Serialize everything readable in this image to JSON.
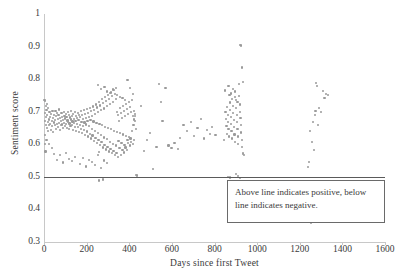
{
  "chart_data": {
    "type": "scatter",
    "title": "",
    "xlabel": "Days since first Tweet",
    "ylabel": "Sentiment score",
    "xlim": [
      0,
      1600
    ],
    "ylim": [
      0.3,
      1.0
    ],
    "xticks": [
      0,
      200,
      400,
      600,
      800,
      1000,
      1200,
      1400,
      1600
    ],
    "yticks": [
      0.3,
      0.4,
      0.5,
      0.6,
      0.7,
      0.8,
      0.9,
      1
    ],
    "xtick_labels": [
      "0",
      "200",
      "400",
      "600",
      "800",
      "1000",
      "1200",
      "1400",
      "1600"
    ],
    "ytick_labels": [
      "0.3",
      "0.4",
      "0.5",
      "0.6",
      "0.7",
      "0.8",
      "0.9",
      "1"
    ],
    "grid": false,
    "legend": null,
    "point_color": "#9a9a9a",
    "reference_line": {
      "y": 0.5,
      "color": "#5a5a5a",
      "label": "neutral sentiment threshold"
    },
    "annotations": [
      {
        "text": "Above line indicates positive, below line indicates negative.",
        "x": 1080,
        "y": 0.455,
        "boxed": true
      }
    ],
    "points": [
      [
        2,
        0.737
      ],
      [
        3,
        0.695
      ],
      [
        4,
        0.672
      ],
      [
        5,
        0.628
      ],
      [
        6,
        0.6
      ],
      [
        7,
        0.578
      ],
      [
        8,
        0.66
      ],
      [
        10,
        0.683
      ],
      [
        12,
        0.705
      ],
      [
        14,
        0.651
      ],
      [
        15,
        0.69
      ],
      [
        17,
        0.668
      ],
      [
        18,
        0.64
      ],
      [
        20,
        0.712
      ],
      [
        22,
        0.676
      ],
      [
        24,
        0.658
      ],
      [
        26,
        0.7
      ],
      [
        28,
        0.684
      ],
      [
        30,
        0.662
      ],
      [
        32,
        0.645
      ],
      [
        34,
        0.693
      ],
      [
        36,
        0.671
      ],
      [
        38,
        0.655
      ],
      [
        40,
        0.702
      ],
      [
        42,
        0.68
      ],
      [
        44,
        0.638
      ],
      [
        46,
        0.667
      ],
      [
        48,
        0.69
      ],
      [
        50,
        0.659
      ],
      [
        52,
        0.674
      ],
      [
        54,
        0.701
      ],
      [
        56,
        0.648
      ],
      [
        58,
        0.686
      ],
      [
        60,
        0.663
      ],
      [
        62,
        0.696
      ],
      [
        64,
        0.677
      ],
      [
        66,
        0.654
      ],
      [
        68,
        0.689
      ],
      [
        70,
        0.666
      ],
      [
        72,
        0.707
      ],
      [
        74,
        0.643
      ],
      [
        76,
        0.681
      ],
      [
        78,
        0.658
      ],
      [
        80,
        0.672
      ],
      [
        82,
        0.695
      ],
      [
        84,
        0.661
      ],
      [
        86,
        0.684
      ],
      [
        88,
        0.649
      ],
      [
        90,
        0.675
      ],
      [
        92,
        0.7
      ],
      [
        94,
        0.666
      ],
      [
        96,
        0.688
      ],
      [
        98,
        0.657
      ],
      [
        100,
        0.679
      ],
      [
        102,
        0.694
      ],
      [
        104,
        0.662
      ],
      [
        106,
        0.685
      ],
      [
        108,
        0.65
      ],
      [
        110,
        0.673
      ],
      [
        112,
        0.698
      ],
      [
        114,
        0.668
      ],
      [
        116,
        0.646
      ],
      [
        118,
        0.69
      ],
      [
        120,
        0.664
      ],
      [
        122,
        0.682
      ],
      [
        124,
        0.656
      ],
      [
        126,
        0.676
      ],
      [
        128,
        0.703
      ],
      [
        130,
        0.659
      ],
      [
        132,
        0.687
      ],
      [
        134,
        0.67
      ],
      [
        136,
        0.645
      ],
      [
        138,
        0.692
      ],
      [
        140,
        0.665
      ],
      [
        142,
        0.678
      ],
      [
        144,
        0.653
      ],
      [
        146,
        0.699
      ],
      [
        148,
        0.671
      ],
      [
        150,
        0.641
      ],
      [
        152,
        0.686
      ],
      [
        154,
        0.663
      ],
      [
        156,
        0.68
      ],
      [
        158,
        0.652
      ],
      [
        160,
        0.696
      ],
      [
        162,
        0.674
      ],
      [
        164,
        0.637
      ],
      [
        166,
        0.689
      ],
      [
        168,
        0.66
      ],
      [
        170,
        0.683
      ],
      [
        172,
        0.647
      ],
      [
        174,
        0.702
      ],
      [
        176,
        0.669
      ],
      [
        178,
        0.634
      ],
      [
        180,
        0.691
      ],
      [
        182,
        0.656
      ],
      [
        184,
        0.677
      ],
      [
        186,
        0.644
      ],
      [
        188,
        0.705
      ],
      [
        190,
        0.667
      ],
      [
        192,
        0.629
      ],
      [
        194,
        0.693
      ],
      [
        196,
        0.661
      ],
      [
        198,
        0.681
      ],
      [
        200,
        0.639
      ],
      [
        202,
        0.708
      ],
      [
        204,
        0.672
      ],
      [
        206,
        0.624
      ],
      [
        208,
        0.697
      ],
      [
        210,
        0.655
      ],
      [
        212,
        0.685
      ],
      [
        214,
        0.632
      ],
      [
        216,
        0.711
      ],
      [
        218,
        0.675
      ],
      [
        220,
        0.618
      ],
      [
        222,
        0.701
      ],
      [
        224,
        0.648
      ],
      [
        226,
        0.688
      ],
      [
        228,
        0.627
      ],
      [
        230,
        0.716
      ],
      [
        232,
        0.67
      ],
      [
        234,
        0.611
      ],
      [
        236,
        0.706
      ],
      [
        238,
        0.642
      ],
      [
        240,
        0.692
      ],
      [
        242,
        0.62
      ],
      [
        244,
        0.722
      ],
      [
        246,
        0.666
      ],
      [
        248,
        0.604
      ],
      [
        250,
        0.713
      ],
      [
        252,
        0.635
      ],
      [
        254,
        0.698
      ],
      [
        256,
        0.613
      ],
      [
        258,
        0.73
      ],
      [
        259,
        0.576
      ],
      [
        260,
        0.662
      ],
      [
        262,
        0.597
      ],
      [
        264,
        0.719
      ],
      [
        266,
        0.628
      ],
      [
        268,
        0.704
      ],
      [
        270,
        0.606
      ],
      [
        272,
        0.738
      ],
      [
        274,
        0.658
      ],
      [
        276,
        0.59
      ],
      [
        278,
        0.726
      ],
      [
        280,
        0.621
      ],
      [
        282,
        0.71
      ],
      [
        284,
        0.599
      ],
      [
        286,
        0.745
      ],
      [
        288,
        0.654
      ],
      [
        290,
        0.584
      ],
      [
        292,
        0.733
      ],
      [
        294,
        0.615
      ],
      [
        296,
        0.717
      ],
      [
        298,
        0.592
      ],
      [
        300,
        0.752
      ],
      [
        302,
        0.65
      ],
      [
        304,
        0.578
      ],
      [
        306,
        0.74
      ],
      [
        308,
        0.608
      ],
      [
        310,
        0.724
      ],
      [
        312,
        0.586
      ],
      [
        314,
        0.759
      ],
      [
        316,
        0.646
      ],
      [
        318,
        0.572
      ],
      [
        320,
        0.747
      ],
      [
        322,
        0.602
      ],
      [
        324,
        0.731
      ],
      [
        326,
        0.58
      ],
      [
        328,
        0.766
      ],
      [
        330,
        0.642
      ],
      [
        332,
        0.567
      ],
      [
        334,
        0.754
      ],
      [
        336,
        0.596
      ],
      [
        338,
        0.738
      ],
      [
        340,
        0.574
      ],
      [
        342,
        0.7
      ],
      [
        344,
        0.638
      ],
      [
        346,
        0.562
      ],
      [
        348,
        0.69
      ],
      [
        350,
        0.61
      ],
      [
        352,
        0.672
      ],
      [
        354,
        0.588
      ],
      [
        356,
        0.712
      ],
      [
        358,
        0.634
      ],
      [
        360,
        0.568
      ],
      [
        362,
        0.696
      ],
      [
        364,
        0.604
      ],
      [
        366,
        0.68
      ],
      [
        368,
        0.582
      ],
      [
        370,
        0.718
      ],
      [
        372,
        0.63
      ],
      [
        374,
        0.575
      ],
      [
        376,
        0.702
      ],
      [
        378,
        0.598
      ],
      [
        380,
        0.686
      ],
      [
        382,
        0.59
      ],
      [
        384,
        0.724
      ],
      [
        386,
        0.626
      ],
      [
        388,
        0.583
      ],
      [
        390,
        0.708
      ],
      [
        392,
        0.612
      ],
      [
        394,
        0.692
      ],
      [
        396,
        0.604
      ],
      [
        398,
        0.73
      ],
      [
        400,
        0.622
      ],
      [
        402,
        0.596
      ],
      [
        404,
        0.714
      ],
      [
        406,
        0.618
      ],
      [
        408,
        0.698
      ],
      [
        410,
        0.608
      ],
      [
        412,
        0.736
      ],
      [
        414,
        0.64
      ],
      [
        416,
        0.602
      ],
      [
        418,
        0.688
      ],
      [
        420,
        0.658
      ],
      [
        422,
        0.614
      ],
      [
        424,
        0.676
      ],
      [
        426,
        0.694
      ],
      [
        428,
        0.672
      ],
      [
        430,
        0.648
      ],
      [
        118,
        0.556
      ],
      [
        132,
        0.548
      ],
      [
        146,
        0.562
      ],
      [
        168,
        0.54
      ],
      [
        182,
        0.558
      ],
      [
        196,
        0.532
      ],
      [
        210,
        0.552
      ],
      [
        224,
        0.545
      ],
      [
        238,
        0.536
      ],
      [
        252,
        0.566
      ],
      [
        266,
        0.528
      ],
      [
        280,
        0.55
      ],
      [
        294,
        0.542
      ],
      [
        258,
        0.489
      ],
      [
        276,
        0.492
      ],
      [
        60,
        0.552
      ],
      [
        74,
        0.568
      ],
      [
        88,
        0.544
      ],
      [
        102,
        0.573
      ],
      [
        36,
        0.588
      ],
      [
        48,
        0.571
      ],
      [
        24,
        0.602
      ],
      [
        12,
        0.612
      ],
      [
        6,
        0.732
      ],
      [
        9,
        0.718
      ],
      [
        16,
        0.723
      ],
      [
        255,
        0.782
      ],
      [
        268,
        0.77
      ],
      [
        284,
        0.776
      ],
      [
        297,
        0.762
      ],
      [
        310,
        0.758
      ],
      [
        322,
        0.768
      ],
      [
        336,
        0.774
      ],
      [
        342,
        0.752
      ],
      [
        355,
        0.746
      ],
      [
        368,
        0.741
      ],
      [
        380,
        0.736
      ],
      [
        392,
        0.798
      ],
      [
        404,
        0.772
      ],
      [
        416,
        0.754
      ],
      [
        424,
        0.702
      ],
      [
        428,
        0.688
      ],
      [
        430,
        0.505
      ],
      [
        438,
        0.504
      ],
      [
        455,
        0.718
      ],
      [
        468,
        0.58
      ],
      [
        482,
        0.612
      ],
      [
        497,
        0.635
      ],
      [
        512,
        0.523
      ],
      [
        528,
        0.592
      ],
      [
        540,
        0.785
      ],
      [
        548,
        0.73
      ],
      [
        556,
        0.672
      ],
      [
        570,
        0.772
      ],
      [
        584,
        0.596
      ],
      [
        598,
        0.588
      ],
      [
        612,
        0.604
      ],
      [
        628,
        0.585
      ],
      [
        640,
        0.62
      ],
      [
        655,
        0.66
      ],
      [
        672,
        0.64
      ],
      [
        690,
        0.668
      ],
      [
        705,
        0.625
      ],
      [
        720,
        0.65
      ],
      [
        736,
        0.678
      ],
      [
        752,
        0.618
      ],
      [
        765,
        0.643
      ],
      [
        778,
        0.632
      ],
      [
        790,
        0.652
      ],
      [
        805,
        0.628
      ],
      [
        845,
        0.612
      ],
      [
        850,
        0.765
      ],
      [
        852,
        0.7
      ],
      [
        854,
        0.678
      ],
      [
        856,
        0.655
      ],
      [
        858,
        0.632
      ],
      [
        860,
        0.715
      ],
      [
        862,
        0.69
      ],
      [
        864,
        0.668
      ],
      [
        866,
        0.646
      ],
      [
        868,
        0.624
      ],
      [
        870,
        0.752
      ],
      [
        872,
        0.728
      ],
      [
        874,
        0.706
      ],
      [
        876,
        0.684
      ],
      [
        878,
        0.662
      ],
      [
        880,
        0.64
      ],
      [
        882,
        0.618
      ],
      [
        884,
        0.74
      ],
      [
        886,
        0.718
      ],
      [
        888,
        0.696
      ],
      [
        890,
        0.674
      ],
      [
        892,
        0.652
      ],
      [
        894,
        0.63
      ],
      [
        896,
        0.608
      ],
      [
        898,
        0.762
      ],
      [
        900,
        0.735
      ],
      [
        902,
        0.712
      ],
      [
        904,
        0.69
      ],
      [
        906,
        0.668
      ],
      [
        908,
        0.646
      ],
      [
        910,
        0.624
      ],
      [
        912,
        0.602
      ],
      [
        914,
        0.786
      ],
      [
        916,
        0.748
      ],
      [
        918,
        0.722
      ],
      [
        920,
        0.7
      ],
      [
        922,
        0.68
      ],
      [
        924,
        0.658
      ],
      [
        926,
        0.636
      ],
      [
        928,
        0.614
      ],
      [
        930,
        0.592
      ],
      [
        932,
        0.572
      ],
      [
        934,
        0.79
      ],
      [
        866,
        0.78
      ],
      [
        878,
        0.756
      ],
      [
        888,
        0.77
      ],
      [
        898,
        0.744
      ],
      [
        908,
        0.73
      ],
      [
        918,
        0.905
      ],
      [
        926,
        0.903
      ],
      [
        930,
        0.836
      ],
      [
        935,
        0.57
      ],
      [
        940,
        0.568
      ],
      [
        862,
        0.5
      ],
      [
        872,
        0.498
      ],
      [
        902,
        0.508
      ],
      [
        912,
        0.502
      ],
      [
        920,
        0.497
      ],
      [
        1240,
        0.53
      ],
      [
        1245,
        0.545
      ],
      [
        1248,
        0.64
      ],
      [
        1252,
        0.358
      ],
      [
        1258,
        0.608
      ],
      [
        1262,
        0.668
      ],
      [
        1266,
        0.583
      ],
      [
        1270,
        0.69
      ],
      [
        1274,
        0.702
      ],
      [
        1278,
        0.788
      ],
      [
        1282,
        0.78
      ],
      [
        1286,
        0.66
      ],
      [
        1292,
        0.712
      ],
      [
        1300,
        0.7
      ],
      [
        1308,
        0.763
      ],
      [
        1316,
        0.742
      ],
      [
        1324,
        0.755
      ],
      [
        1334,
        0.752
      ]
    ]
  }
}
